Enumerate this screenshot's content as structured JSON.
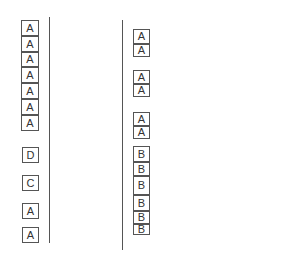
{
  "left_column": {
    "line": {
      "x": 49,
      "top": 17,
      "bottom": 243
    },
    "boxes": [
      {
        "label": "A",
        "x": 21,
        "y": 20,
        "w": 18,
        "h": 16
      },
      {
        "label": "A",
        "x": 21,
        "y": 36,
        "w": 18,
        "h": 16
      },
      {
        "label": "A",
        "x": 21,
        "y": 52,
        "w": 18,
        "h": 15
      },
      {
        "label": "A",
        "x": 21,
        "y": 67,
        "w": 18,
        "h": 16
      },
      {
        "label": "A",
        "x": 21,
        "y": 83,
        "w": 18,
        "h": 16
      },
      {
        "label": "A",
        "x": 21,
        "y": 99,
        "w": 18,
        "h": 16
      },
      {
        "label": "A",
        "x": 21,
        "y": 115,
        "w": 18,
        "h": 16
      },
      {
        "label": "D",
        "x": 22,
        "y": 147,
        "w": 17,
        "h": 16
      },
      {
        "label": "C",
        "x": 22,
        "y": 175,
        "w": 17,
        "h": 16
      },
      {
        "label": "A",
        "x": 22,
        "y": 203,
        "w": 17,
        "h": 16
      },
      {
        "label": "A",
        "x": 22,
        "y": 227,
        "w": 17,
        "h": 16
      }
    ]
  },
  "right_column": {
    "line": {
      "x": 122,
      "top": 20,
      "bottom": 250
    },
    "boxes": [
      {
        "label": "A",
        "x": 133,
        "y": 29,
        "w": 17,
        "h": 15
      },
      {
        "label": "A",
        "x": 133,
        "y": 44,
        "w": 17,
        "h": 13
      },
      {
        "label": "A",
        "x": 133,
        "y": 70,
        "w": 17,
        "h": 14
      },
      {
        "label": "A",
        "x": 133,
        "y": 84,
        "w": 17,
        "h": 13
      },
      {
        "label": "A",
        "x": 133,
        "y": 112,
        "w": 17,
        "h": 14
      },
      {
        "label": "A",
        "x": 133,
        "y": 126,
        "w": 17,
        "h": 13
      },
      {
        "label": "B",
        "x": 133,
        "y": 146,
        "w": 17,
        "h": 16
      },
      {
        "label": "B",
        "x": 133,
        "y": 162,
        "w": 17,
        "h": 14
      },
      {
        "label": "B",
        "x": 133,
        "y": 176,
        "w": 17,
        "h": 19
      },
      {
        "label": "B",
        "x": 133,
        "y": 195,
        "w": 17,
        "h": 16
      },
      {
        "label": "B",
        "x": 133,
        "y": 211,
        "w": 17,
        "h": 13
      },
      {
        "label": "B",
        "x": 133,
        "y": 224,
        "w": 17,
        "h": 11
      }
    ]
  }
}
